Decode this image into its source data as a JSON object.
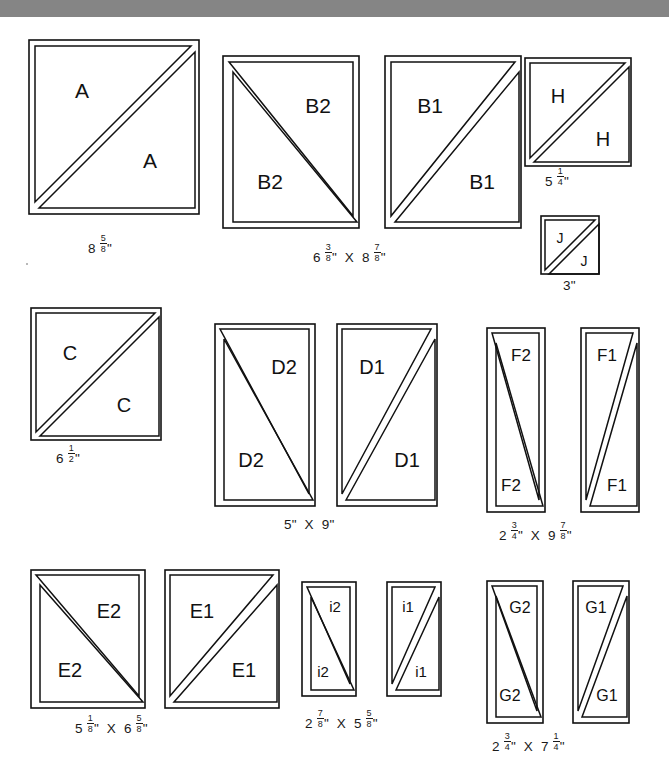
{
  "page": {
    "background_color": "#ffffff",
    "banner_color": "#858585",
    "line_color": "#111111"
  },
  "rows": [
    {
      "name": "row-1",
      "pieces": [
        {
          "id": "A",
          "labels": [
            "A",
            "A"
          ],
          "diagonal": "bl-tr",
          "dimension": "8 5/8\"",
          "dimension_parts": [
            {
              "whole": "8",
              "num": "5",
              "den": "8",
              "unit": "\""
            }
          ]
        },
        {
          "id": "B2",
          "labels": [
            "B2",
            "B2"
          ],
          "diagonal": "tl-br",
          "dimension": "6 3/8\" X 8 7/8\"",
          "dimension_parts": [
            {
              "whole": "6",
              "num": "3",
              "den": "8",
              "unit": "\""
            },
            {
              "sep": "X"
            },
            {
              "whole": "8",
              "num": "7",
              "den": "8",
              "unit": "\""
            }
          ]
        },
        {
          "id": "B1",
          "labels": [
            "B1",
            "B1"
          ],
          "diagonal": "bl-tr",
          "dimension": ""
        },
        {
          "id": "H",
          "labels": [
            "H",
            "H"
          ],
          "diagonal": "bl-tr",
          "dimension": "5 1/4\"",
          "dimension_parts": [
            {
              "whole": "5",
              "num": "1",
              "den": "4",
              "unit": "\""
            }
          ]
        },
        {
          "id": "J",
          "labels": [
            "J",
            "J"
          ],
          "diagonal": "bl-tr",
          "dimension": "3\"",
          "dimension_parts": [
            {
              "whole": "3",
              "unit": "\""
            }
          ]
        }
      ]
    },
    {
      "name": "row-2",
      "pieces": [
        {
          "id": "C",
          "labels": [
            "C",
            "C"
          ],
          "diagonal": "bl-tr",
          "dimension": "6 1/2\"",
          "dimension_parts": [
            {
              "whole": "6",
              "num": "1",
              "den": "2",
              "unit": "\""
            }
          ]
        },
        {
          "id": "D2",
          "labels": [
            "D2",
            "D2"
          ],
          "diagonal": "tl-br",
          "dimension": "5\" X 9\"",
          "dimension_parts": [
            {
              "whole": "5",
              "unit": "\""
            },
            {
              "sep": "X"
            },
            {
              "whole": "9",
              "unit": "\""
            }
          ]
        },
        {
          "id": "D1",
          "labels": [
            "D1",
            "D1"
          ],
          "diagonal": "bl-tr",
          "dimension": ""
        },
        {
          "id": "F2",
          "labels": [
            "F2",
            "F2"
          ],
          "diagonal": "tl-br",
          "dimension": "2 3/4\" X 9 7/8\"",
          "dimension_parts": [
            {
              "whole": "2",
              "num": "3",
              "den": "4",
              "unit": "\""
            },
            {
              "sep": "X"
            },
            {
              "whole": "9",
              "num": "7",
              "den": "8",
              "unit": "\""
            }
          ]
        },
        {
          "id": "F1",
          "labels": [
            "F1",
            "F1"
          ],
          "diagonal": "bl-tr",
          "dimension": ""
        }
      ]
    },
    {
      "name": "row-3",
      "pieces": [
        {
          "id": "E2",
          "labels": [
            "E2",
            "E2"
          ],
          "diagonal": "tl-br",
          "dimension": "5 1/8\" X 6 5/8\"",
          "dimension_parts": [
            {
              "whole": "5",
              "num": "1",
              "den": "8",
              "unit": "\""
            },
            {
              "sep": "X"
            },
            {
              "whole": "6",
              "num": "5",
              "den": "8",
              "unit": "\""
            }
          ]
        },
        {
          "id": "E1",
          "labels": [
            "E1",
            "E1"
          ],
          "diagonal": "bl-tr",
          "dimension": ""
        },
        {
          "id": "i2",
          "labels": [
            "i2",
            "i2"
          ],
          "diagonal": "tl-br",
          "dimension": "2 7/8\" X 5 5/8\"",
          "dimension_parts": [
            {
              "whole": "2",
              "num": "7",
              "den": "8",
              "unit": "\""
            },
            {
              "sep": "X"
            },
            {
              "whole": "5",
              "num": "5",
              "den": "8",
              "unit": "\""
            }
          ]
        },
        {
          "id": "i1",
          "labels": [
            "i1",
            "i1"
          ],
          "diagonal": "bl-tr",
          "dimension": ""
        },
        {
          "id": "G2",
          "labels": [
            "G2",
            "G2"
          ],
          "diagonal": "tl-br",
          "dimension": "2 3/4\" X 7 1/4\"",
          "dimension_parts": [
            {
              "whole": "2",
              "num": "3",
              "den": "4",
              "unit": "\""
            },
            {
              "sep": "X"
            },
            {
              "whole": "7",
              "num": "1",
              "den": "4",
              "unit": "\""
            }
          ]
        },
        {
          "id": "G1",
          "labels": [
            "G1",
            "G1"
          ],
          "diagonal": "bl-tr",
          "dimension": ""
        }
      ]
    }
  ],
  "dims": {
    "A": "8 5/8\"",
    "B": "6 3/8\" X 8 7/8\"",
    "H": "5 1/4\"",
    "J": "3\"",
    "C": "6 1/2\"",
    "D": "5\" X 9\"",
    "F": "2 3/4\" X 9 7/8\"",
    "E": "5 1/8\" X 6 5/8\"",
    "i": "2 7/8\" X 5 5/8\"",
    "G": "2 3/4\" X 7 1/4\""
  },
  "labels": {
    "A1": "A",
    "A2": "A",
    "B2a": "B2",
    "B2b": "B2",
    "B1a": "B1",
    "B1b": "B1",
    "Ha": "H",
    "Hb": "H",
    "Ja": "J",
    "Jb": "J",
    "Ca": "C",
    "Cb": "C",
    "D2a": "D2",
    "D2b": "D2",
    "D1a": "D1",
    "D1b": "D1",
    "F2a": "F2",
    "F2b": "F2",
    "F1a": "F1",
    "F1b": "F1",
    "E2a": "E2",
    "E2b": "E2",
    "E1a": "E1",
    "E1b": "E1",
    "i2a": "i2",
    "i2b": "i2",
    "i1a": "i1",
    "i1b": "i1",
    "G2a": "G2",
    "G2b": "G2",
    "G1a": "G1",
    "G1b": "G1"
  }
}
